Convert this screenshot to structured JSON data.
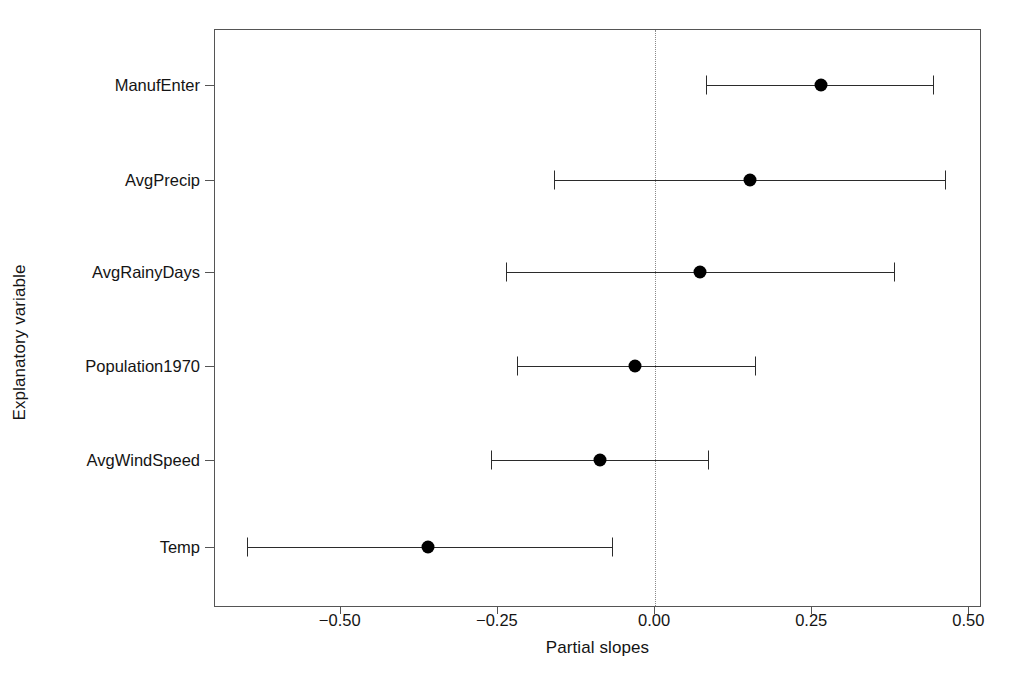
{
  "chart_data": {
    "type": "scatter",
    "title": "",
    "subtitle": "",
    "xlabel": "Partial slopes",
    "ylabel": "Explanatory variable",
    "orientation": "horizontal",
    "grid": false,
    "legend": null,
    "xlim": [
      -0.7,
      0.52
    ],
    "xticks": [
      -0.5,
      -0.25,
      0.0,
      0.25,
      0.5
    ],
    "xtick_labels": [
      "−0.50",
      "−0.25",
      "0.00",
      "0.25",
      "0.50"
    ],
    "reference_line": {
      "value": 0.0,
      "style": "dotted",
      "color": "#8a8a8a"
    },
    "categories": [
      "ManufEnter",
      "AvgPrecip",
      "AvgRainyDays",
      "Population1970",
      "AvgWindSpeed",
      "Temp"
    ],
    "series": [
      {
        "name": "Partial slope estimate with confidence interval",
        "marker": "filled-circle",
        "color": "#000000",
        "points": [
          {
            "category": "ManufEnter",
            "estimate": 0.265,
            "low": 0.082,
            "high": 0.443
          },
          {
            "category": "AvgPrecip",
            "estimate": 0.153,
            "low": -0.159,
            "high": 0.463
          },
          {
            "category": "AvgRainyDays",
            "estimate": 0.073,
            "low": -0.236,
            "high": 0.381
          },
          {
            "category": "Population1970",
            "estimate": -0.03,
            "low": -0.218,
            "high": 0.161
          },
          {
            "category": "AvgWindSpeed",
            "estimate": -0.086,
            "low": -0.26,
            "high": 0.086
          },
          {
            "category": "Temp",
            "estimate": -0.36,
            "low": -0.647,
            "high": -0.067
          }
        ]
      }
    ]
  },
  "colors": {
    "marker": "#000000",
    "interval": "#2b2b2b",
    "frame": "#555555",
    "reference": "#8a8a8a",
    "text": "#141414",
    "background": "#ffffff"
  }
}
